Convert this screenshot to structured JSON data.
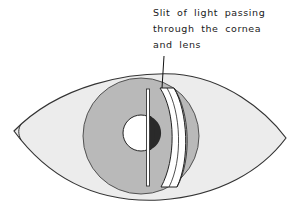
{
  "figure": {
    "type": "eye-slit-lamp-illustration",
    "annotation": {
      "lines": [
        "Slit of light passing",
        "through the cornea",
        "and lens"
      ]
    },
    "parts": [
      {
        "name": "eyelid-outline",
        "label": ""
      },
      {
        "name": "iris",
        "label": ""
      },
      {
        "name": "pupil",
        "label": ""
      },
      {
        "name": "cornea-slit",
        "label": ""
      },
      {
        "name": "lens-slit-band",
        "label": ""
      }
    ],
    "colors": {
      "background": "#ffffff",
      "sclera": "#ececec",
      "iris": "#b9b9b9",
      "pupil": "#ffffff",
      "pupil_shadow": "#2a2a2a",
      "slit": "#ffffff",
      "outline": "#333333"
    }
  }
}
